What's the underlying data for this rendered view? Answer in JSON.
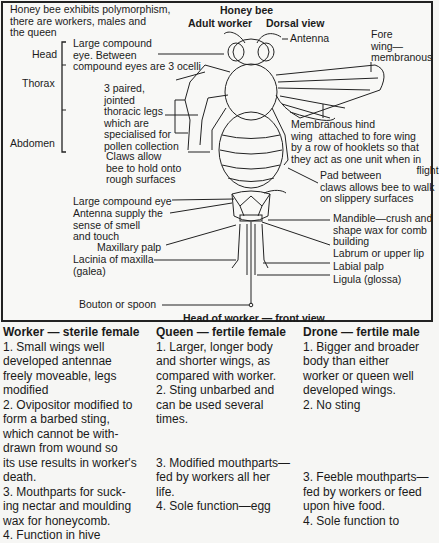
{
  "title": "Honey bee",
  "intro": "Honey bee exhibits polymorphism,\nthere are workers, males and\nthe queen",
  "dorsal": {
    "subtitle_left": "Adult worker",
    "subtitle_right": "Dorsal view",
    "regions": [
      "Head",
      "Thorax",
      "Abdomen"
    ],
    "labels": {
      "eye": "Large compound\neye. Between\ncompound eyes are 3 ocelli",
      "legs": "3 paired,\njointed\nthoracic legs\nwhich are\nspecialised for\npollen collection",
      "claws": "Claws allow\nbee to hold onto\nrough surfaces",
      "antenna": "Antenna",
      "fore_wing": "Fore\nwing—\nmembranous",
      "hind_wing": "Membranous hind\nwing  attached to fore wing\nby a row of hooklets so that\nthey act as one unit when in\n                                           flight",
      "pad": "Pad between\nclaws allows bee to walk\non slippery surfaces"
    }
  },
  "front": {
    "caption": "Head of worker — front view",
    "labels_left": [
      "Large compound eye",
      "Antenna supply the\nsense of smell\nand touch",
      "Maxillary palp",
      "Lacinia of maxilla\n(galea)",
      "Bouton or spoon"
    ],
    "labels_right": [
      "Mandible—crush and\nshape wax for comb\nbuilding",
      "Labrum or upper lip",
      "Labial palp",
      "Ligula (glossa)"
    ]
  },
  "castes": [
    {
      "heading": "Worker — sterile female",
      "points": [
        "1. Small wings well\ndeveloped antennae\nfreely moveable, legs\nmodified",
        "2. Ovipositor modified to\nform a barbed sting,\nwhich cannot be with-\ndrawn from wound so\nits use results in worker's\ndeath.",
        "3. Mouthparts for suck-\ning nectar and moulding\nwax for honeycomb.",
        "4. Function in hive"
      ]
    },
    {
      "heading": "Queen — fertile female",
      "points": [
        "1. Larger, longer body\nand shorter wings, as\ncompared with worker.\n",
        "2. Sting unbarbed and\ncan be used several\ntimes.\n\n\n",
        "3. Modified mouthparts—\nfed by workers all her\nlife.",
        "4. Sole function—egg"
      ]
    },
    {
      "heading": "Drone — fertile male",
      "points": [
        "1. Bigger and broader\nbody than either\nworker or queen well\ndeveloped wings.",
        "2. No sting\n\n\n\n\n",
        "3. Feeble mouthparts—\nfed by workers or feed\nupon hive food.",
        "4. Sole function to"
      ]
    }
  ]
}
